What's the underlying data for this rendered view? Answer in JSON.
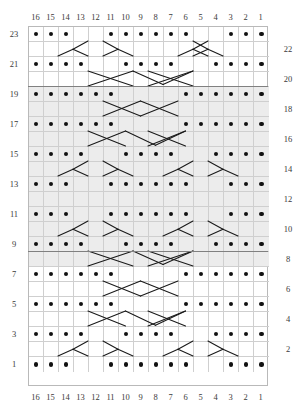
{
  "chart_data": {
    "type": "table",
    "columns": 16,
    "rows": 23,
    "col_labels_top": [
      "16",
      "15",
      "14",
      "13",
      "12",
      "11",
      "10",
      "9",
      "8",
      "7",
      "6",
      "5",
      "4",
      "3",
      "2",
      "1"
    ],
    "col_labels_bottom": [
      "16",
      "15",
      "14",
      "13",
      "12",
      "11",
      "10",
      "9",
      "8",
      "7",
      "6",
      "5",
      "4",
      "3",
      "2",
      "1"
    ],
    "row_labels_left": [
      "23",
      "21",
      "19",
      "17",
      "15",
      "13",
      "11",
      "9",
      "7",
      "5",
      "3",
      "1"
    ],
    "row_labels_right": [
      "22",
      "20",
      "18",
      "16",
      "14",
      "12",
      "10",
      "8",
      "6",
      "4",
      "2"
    ],
    "legend": [],
    "colors": {
      "dot": "#111111",
      "grid_line": "#cfcfcf",
      "grid_border": "#b9b9b9",
      "shaded_row": "#ececec",
      "separator": "#808080",
      "label_text": "#3a3a3a",
      "background": "#ffffff"
    },
    "shaded_row_range": [
      9,
      19
    ],
    "separator_rows": [
      8,
      19
    ],
    "dot_symbol": "purl",
    "stroke_symbol": "cable-cross",
    "rows_data": [
      {
        "row": 23,
        "shaded": false,
        "dots": [
          16,
          15,
          14,
          11,
          10,
          9,
          8,
          7,
          6,
          3,
          2,
          1
        ]
      },
      {
        "row": 22,
        "shaded": false,
        "dots": []
      },
      {
        "row": 21,
        "shaded": false,
        "dots": [
          16,
          15,
          14,
          13,
          10,
          9,
          8,
          7,
          4,
          3,
          2,
          1
        ]
      },
      {
        "row": 20,
        "shaded": false,
        "dots": []
      },
      {
        "row": 19,
        "shaded": true,
        "dots": [
          16,
          15,
          14,
          13,
          12,
          11,
          6,
          5,
          4,
          3,
          2,
          1
        ]
      },
      {
        "row": 18,
        "shaded": true,
        "dots": []
      },
      {
        "row": 17,
        "shaded": true,
        "dots": [
          16,
          15,
          14,
          13,
          12,
          11,
          6,
          5,
          4,
          3,
          2,
          1
        ]
      },
      {
        "row": 16,
        "shaded": true,
        "dots": []
      },
      {
        "row": 15,
        "shaded": true,
        "dots": [
          16,
          15,
          14,
          13,
          10,
          9,
          8,
          7,
          4,
          3,
          2,
          1
        ]
      },
      {
        "row": 14,
        "shaded": true,
        "dots": []
      },
      {
        "row": 13,
        "shaded": true,
        "dots": [
          16,
          15,
          14,
          11,
          10,
          9,
          8,
          7,
          6,
          3,
          2,
          1
        ]
      },
      {
        "row": 12,
        "shaded": true,
        "dots": []
      },
      {
        "row": 11,
        "shaded": true,
        "dots": [
          16,
          15,
          14,
          11,
          10,
          9,
          8,
          7,
          6,
          3,
          2,
          1
        ]
      },
      {
        "row": 10,
        "shaded": true,
        "dots": []
      },
      {
        "row": 9,
        "shaded": true,
        "dots": [
          16,
          15,
          14,
          13,
          10,
          9,
          8,
          7,
          4,
          3,
          2,
          1
        ]
      },
      {
        "row": 8,
        "shaded": true,
        "dots": []
      },
      {
        "row": 7,
        "shaded": false,
        "dots": [
          16,
          15,
          14,
          13,
          12,
          11,
          6,
          5,
          4,
          3,
          2,
          1
        ]
      },
      {
        "row": 6,
        "shaded": false,
        "dots": []
      },
      {
        "row": 5,
        "shaded": false,
        "dots": [
          16,
          15,
          14,
          13,
          12,
          11,
          6,
          5,
          4,
          3,
          2,
          1
        ]
      },
      {
        "row": 4,
        "shaded": false,
        "dots": []
      },
      {
        "row": 3,
        "shaded": false,
        "dots": [
          16,
          15,
          14,
          13,
          10,
          9,
          8,
          7,
          4,
          3,
          2,
          1
        ]
      },
      {
        "row": 2,
        "shaded": false,
        "dots": []
      },
      {
        "row": 1,
        "shaded": false,
        "dots": [
          16,
          15,
          14,
          11,
          10,
          9,
          8,
          7,
          6,
          3,
          2,
          1
        ]
      }
    ],
    "strokes": [
      {
        "row": 22,
        "segments": [
          [
            12.0,
            0.0,
            13.0,
            0.55
          ],
          [
            13.0,
            0.55,
            12.0,
            1.0
          ],
          [
            13.0,
            0.55,
            14.0,
            1.0
          ],
          [
            11.0,
            0.0,
            10.0,
            0.55
          ],
          [
            10.0,
            0.55,
            11.0,
            1.0
          ],
          [
            10.0,
            0.55,
            9.0,
            1.0
          ],
          [
            5.0,
            0.0,
            4.0,
            0.55
          ],
          [
            4.0,
            0.55,
            5.0,
            1.0
          ],
          [
            4.0,
            0.55,
            3.0,
            1.0
          ],
          [
            4.0,
            0.0,
            5.0,
            0.55
          ],
          [
            5.0,
            0.55,
            4.0,
            1.0
          ],
          [
            5.0,
            0.55,
            6.0,
            1.0
          ]
        ]
      },
      {
        "row": 20,
        "segments": [
          [
            12.0,
            0.0,
            9.0,
            1.0
          ],
          [
            9.0,
            0.0,
            12.0,
            1.0
          ],
          [
            9.0,
            0.0,
            7.0,
            0.9
          ],
          [
            7.0,
            0.9,
            5.0,
            0.0
          ],
          [
            5.0,
            0.0,
            8.0,
            1.0
          ],
          [
            8.0,
            0.0,
            5.0,
            1.0
          ]
        ]
      },
      {
        "row": 18,
        "segments": [
          [
            11.0,
            0.0,
            8.5,
            1.0
          ],
          [
            8.5,
            0.0,
            11.0,
            1.0
          ],
          [
            8.5,
            0.0,
            6.0,
            1.0
          ],
          [
            6.0,
            0.0,
            8.5,
            1.0
          ]
        ]
      },
      {
        "row": 16,
        "segments": [
          [
            12.0,
            0.0,
            9.5,
            1.0
          ],
          [
            9.5,
            0.0,
            12.0,
            1.0
          ],
          [
            9.5,
            0.0,
            7.5,
            0.95
          ],
          [
            7.5,
            0.95,
            5.5,
            0.0
          ],
          [
            5.5,
            0.0,
            8.0,
            1.0
          ],
          [
            8.0,
            0.0,
            5.5,
            1.0
          ]
        ]
      },
      {
        "row": 14,
        "segments": [
          [
            12.0,
            0.0,
            13.0,
            0.55
          ],
          [
            13.0,
            0.55,
            12.0,
            1.0
          ],
          [
            13.0,
            0.55,
            14.0,
            1.0
          ],
          [
            11.0,
            0.0,
            10.0,
            0.55
          ],
          [
            10.0,
            0.55,
            11.0,
            1.0
          ],
          [
            10.0,
            0.55,
            9.0,
            1.0
          ],
          [
            5.0,
            0.0,
            6.0,
            0.55
          ],
          [
            6.0,
            0.55,
            5.0,
            1.0
          ],
          [
            6.0,
            0.55,
            7.0,
            1.0
          ],
          [
            4.0,
            0.0,
            3.0,
            0.55
          ],
          [
            3.0,
            0.55,
            4.0,
            1.0
          ],
          [
            3.0,
            0.55,
            2.0,
            1.0
          ]
        ]
      },
      {
        "row": 12,
        "segments": []
      },
      {
        "row": 10,
        "segments": [
          [
            12.0,
            0.0,
            13.0,
            0.55
          ],
          [
            13.0,
            0.55,
            12.0,
            1.0
          ],
          [
            13.0,
            0.55,
            14.0,
            1.0
          ],
          [
            11.0,
            0.0,
            10.0,
            0.55
          ],
          [
            10.0,
            0.55,
            11.0,
            1.0
          ],
          [
            10.0,
            0.55,
            9.0,
            1.0
          ],
          [
            5.0,
            0.0,
            6.0,
            0.55
          ],
          [
            6.0,
            0.55,
            5.0,
            1.0
          ],
          [
            6.0,
            0.55,
            7.0,
            1.0
          ],
          [
            4.0,
            0.0,
            3.0,
            0.55
          ],
          [
            3.0,
            0.55,
            4.0,
            1.0
          ],
          [
            3.0,
            0.55,
            2.0,
            1.0
          ]
        ]
      },
      {
        "row": 8,
        "segments": [
          [
            12.0,
            0.0,
            9.0,
            1.0
          ],
          [
            9.0,
            0.0,
            12.0,
            1.0
          ],
          [
            9.0,
            0.0,
            7.0,
            0.9
          ],
          [
            7.0,
            0.9,
            5.0,
            0.0
          ],
          [
            5.0,
            0.0,
            8.0,
            1.0
          ],
          [
            8.0,
            0.0,
            5.0,
            1.0
          ]
        ]
      },
      {
        "row": 6,
        "segments": [
          [
            11.0,
            0.0,
            8.5,
            1.0
          ],
          [
            8.5,
            0.0,
            11.0,
            1.0
          ],
          [
            8.5,
            0.0,
            6.0,
            1.0
          ],
          [
            6.0,
            0.0,
            8.5,
            1.0
          ]
        ]
      },
      {
        "row": 4,
        "segments": [
          [
            12.0,
            0.0,
            9.5,
            1.0
          ],
          [
            9.5,
            0.0,
            12.0,
            1.0
          ],
          [
            9.5,
            0.0,
            7.5,
            0.95
          ],
          [
            7.5,
            0.95,
            5.5,
            0.0
          ],
          [
            5.5,
            0.0,
            8.0,
            1.0
          ],
          [
            8.0,
            0.0,
            5.5,
            1.0
          ]
        ]
      },
      {
        "row": 2,
        "segments": [
          [
            12.0,
            0.0,
            13.0,
            0.55
          ],
          [
            13.0,
            0.55,
            12.0,
            1.0
          ],
          [
            13.0,
            0.55,
            14.0,
            1.0
          ],
          [
            11.0,
            0.0,
            10.0,
            0.55
          ],
          [
            10.0,
            0.55,
            11.0,
            1.0
          ],
          [
            10.0,
            0.55,
            9.0,
            1.0
          ],
          [
            5.0,
            0.0,
            6.0,
            0.55
          ],
          [
            6.0,
            0.55,
            5.0,
            1.0
          ],
          [
            6.0,
            0.55,
            7.0,
            1.0
          ],
          [
            4.0,
            0.0,
            3.0,
            0.55
          ],
          [
            3.0,
            0.55,
            4.0,
            1.0
          ],
          [
            3.0,
            0.55,
            2.0,
            1.0
          ]
        ]
      }
    ]
  }
}
